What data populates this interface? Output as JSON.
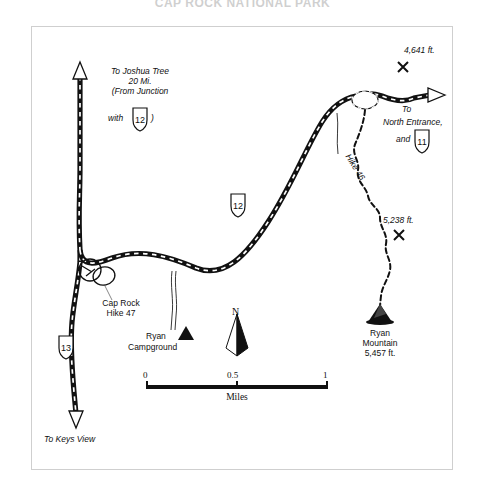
{
  "figure": {
    "title": "CAP ROCK NATIONAL PARK",
    "frame_color": "#cfcfcf",
    "ink_color": "#111111",
    "background": "#ffffff"
  },
  "labels": {
    "joshua_tree": {
      "line1": "To Joshua Tree",
      "line2": "20 Mi.",
      "line3": "(From Junction",
      "line4": "with",
      "line5": ")"
    },
    "north_entrance": {
      "line1": "To",
      "line2": "North Entrance,",
      "line3": "and"
    },
    "keys_view": "To Keys View",
    "cap_rock": {
      "line1": "Cap Rock",
      "line2": "Hike 47"
    },
    "ryan_campground": {
      "line1": "Ryan",
      "line2": "Campground"
    },
    "ryan_mountain": {
      "line1": "Ryan",
      "line2": "Mountain",
      "line3": "5,457 ft."
    },
    "hike_46": "Hike 46",
    "peak_4641": "4,641 ft.",
    "peak_5238": "5,238 ft."
  },
  "shields": {
    "joshua_tree_route": "12",
    "main_route": "12",
    "north_entrance_route": "11",
    "keys_view_route": "13"
  },
  "scale": {
    "ticks": [
      "0",
      "0.5",
      "1"
    ],
    "unit": "Miles"
  },
  "compass": {
    "label": "N"
  },
  "markers": {
    "peak_x_glyph": "✕",
    "campground_glyph": "tent-triangle",
    "summit_glyph": "mountain-peak"
  }
}
